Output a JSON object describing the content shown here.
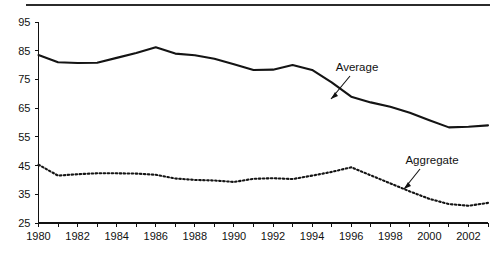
{
  "chart_data": {
    "type": "line",
    "title": "",
    "subtitle": "",
    "xlabel": "",
    "ylabel": "",
    "grid": false,
    "legend_position": "inline-annotation",
    "xlim": [
      1980,
      2003
    ],
    "ylim": [
      25,
      95
    ],
    "y_ticks": [
      95,
      85,
      75,
      65,
      55,
      45,
      35,
      25
    ],
    "x_ticks": [
      1980,
      1981,
      1982,
      1983,
      1984,
      1985,
      1986,
      1987,
      1988,
      1989,
      1990,
      1991,
      1992,
      1993,
      1994,
      1995,
      1996,
      1997,
      1998,
      1999,
      2000,
      2001,
      2002,
      2003
    ],
    "x_tick_labels": [
      "1980",
      "",
      "1982",
      "",
      "1984",
      "",
      "1986",
      "",
      "1988",
      "",
      "1990",
      "",
      "1992",
      "",
      "1994",
      "",
      "1996",
      "",
      "1998",
      "",
      "2000",
      "",
      "2002",
      ""
    ],
    "x": [
      1980,
      1981,
      1982,
      1983,
      1984,
      1985,
      1986,
      1987,
      1988,
      1989,
      1990,
      1991,
      1992,
      1993,
      1994,
      1995,
      1996,
      1997,
      1998,
      1999,
      2000,
      2001,
      2002,
      2003
    ],
    "series": [
      {
        "name": "Average",
        "style": "solid",
        "color": "#141414",
        "values": [
          83.5,
          81.0,
          80.7,
          80.8,
          82.5,
          84.2,
          86.2,
          84.0,
          83.4,
          82.2,
          80.3,
          78.3,
          78.4,
          80.0,
          78.3,
          74.0,
          69.0,
          67.0,
          65.5,
          63.4,
          60.8,
          58.3,
          58.5,
          59.0
        ]
      },
      {
        "name": "Aggregate",
        "style": "dotted",
        "color": "#141414",
        "values": [
          45.3,
          41.5,
          42.0,
          42.3,
          42.3,
          42.2,
          41.8,
          40.5,
          40.0,
          39.8,
          39.3,
          40.4,
          40.6,
          40.3,
          41.5,
          42.8,
          44.4,
          41.6,
          38.8,
          36.0,
          33.4,
          31.6,
          31.0,
          32.0
        ]
      }
    ],
    "annotations": [
      {
        "text": "Average",
        "x_label": 357,
        "y_label": 71,
        "target_x": 357,
        "target_y": 103
      },
      {
        "text": "Aggregate",
        "x_label": 430,
        "y_label": 164,
        "target_x": 403,
        "target_y": 189
      }
    ]
  },
  "axis": {
    "y_tick_labels": [
      "95",
      "85",
      "75",
      "65",
      "55",
      "45",
      "35",
      "25"
    ],
    "x_tick_labels": [
      "1980",
      "1982",
      "1984",
      "1986",
      "1988",
      "1990",
      "1992",
      "1994",
      "1996",
      "1998",
      "2000",
      "2002"
    ]
  },
  "labels": {
    "average": "Average",
    "aggregate": "Aggregate"
  },
  "colors": {
    "ink": "#141414",
    "axis": "#111111",
    "background": "#ffffff"
  }
}
